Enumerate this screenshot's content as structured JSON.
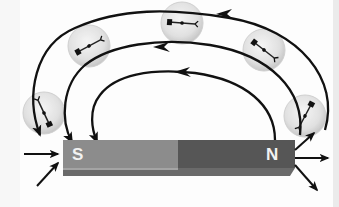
{
  "diagram": {
    "magnet": {
      "south_label": "S",
      "north_label": "N",
      "south_color": "#8c8c8c",
      "north_color": "#565656",
      "bottom_edge_color": "#6a6a6a"
    },
    "field_lines": {
      "count": 3,
      "direction": "from N pole around to S pole",
      "color": "#111111"
    },
    "compasses": [
      {
        "position": "left-near-S",
        "needle_pointing": "down-right toward S"
      },
      {
        "position": "upper-left",
        "needle_pointing": "left"
      },
      {
        "position": "top-center",
        "needle_pointing": "left"
      },
      {
        "position": "upper-right",
        "needle_pointing": "up-left"
      },
      {
        "position": "right-near-N",
        "needle_pointing": "up-right"
      }
    ],
    "pole_arrows": {
      "south": "arrows converge into S pole",
      "north": "arrows diverge out of N pole"
    }
  }
}
